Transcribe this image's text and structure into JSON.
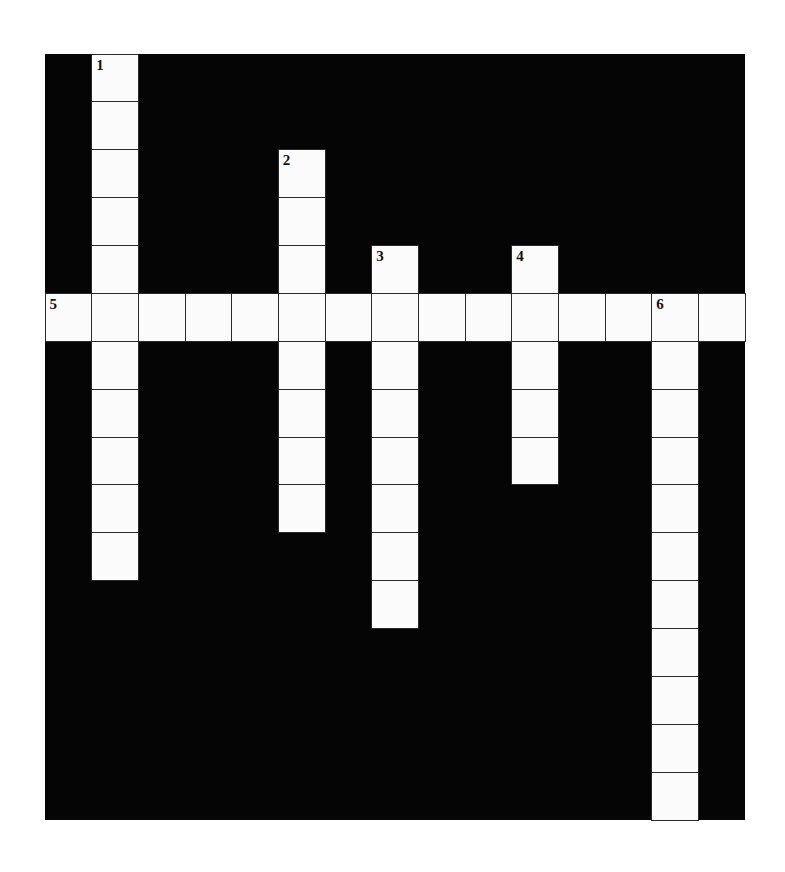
{
  "puzzle": {
    "type": "crossword",
    "grid": {
      "cols": 15,
      "rows": 16,
      "cell_width": 46.67,
      "cell_height": 47.875
    },
    "colors": {
      "block": "#050505",
      "cell": "#fbfbfb",
      "cell_border": "#2a2a2a",
      "number": "#111111"
    },
    "entries": [
      {
        "number": "1",
        "direction": "down",
        "row": 0,
        "col": 1,
        "length": 11
      },
      {
        "number": "2",
        "direction": "down",
        "row": 2,
        "col": 5,
        "length": 8
      },
      {
        "number": "3",
        "direction": "down",
        "row": 4,
        "col": 7,
        "length": 8
      },
      {
        "number": "4",
        "direction": "down",
        "row": 4,
        "col": 10,
        "length": 5
      },
      {
        "number": "5",
        "direction": "across",
        "row": 5,
        "col": 0,
        "length": 15
      },
      {
        "number": "6",
        "direction": "down",
        "row": 5,
        "col": 13,
        "length": 11
      }
    ]
  }
}
